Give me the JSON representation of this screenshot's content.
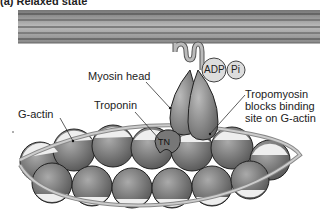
{
  "title": "(a) Relaxed state",
  "labels": {
    "myosin_head": "Myosin head",
    "adp": "ADP",
    "pi": "Pi",
    "g_actin": "G-actin",
    "troponin": "Troponin",
    "tn": "TN",
    "tropomyosin_line1": "Tropomyosin",
    "tropomyosin_line2": "blocks binding",
    "tropomyosin_line3": "site on G-actin"
  }
}
